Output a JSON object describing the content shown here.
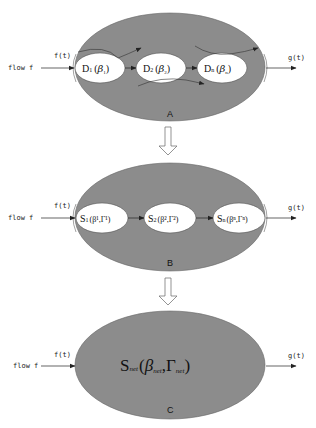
{
  "colors": {
    "outer_fill": "#8c8c8c",
    "inner_fill": "#ffffff",
    "line": "#222222"
  },
  "panels": [
    {
      "id": "A",
      "label": "A",
      "input_label": "flow f",
      "input_signal": "f(t)",
      "output_signal": "g(t)",
      "nodes": [
        {
          "name": "D",
          "index": "1",
          "open": "(",
          "param": "β",
          "param_sub": "1",
          "close": ")"
        },
        {
          "name": "D",
          "index": "2",
          "open": "(",
          "param": "β",
          "param_sub": "2",
          "close": ")"
        },
        {
          "name": "D",
          "index": "n",
          "open": "(",
          "param": "β",
          "param_sub": "n",
          "close": ")"
        }
      ]
    },
    {
      "id": "B",
      "label": "B",
      "input_label": "flow f",
      "input_signal": "f(t)",
      "output_signal": "g(t)",
      "nodes": [
        {
          "name": "S",
          "index": "1",
          "params": "(β¹,Γ¹)"
        },
        {
          "name": "S",
          "index": "2",
          "params": "(β²,Γ²)"
        },
        {
          "name": "S",
          "index": "n",
          "params": "(βⁿ,Γⁿ)"
        }
      ]
    },
    {
      "id": "C",
      "label": "C",
      "input_label": "flow f",
      "input_signal": "f(t)",
      "output_signal": "g(t)",
      "node": {
        "name": "S",
        "name_sub": "net",
        "open": "(",
        "param1": "β",
        "param1_sub": "net",
        "sep": ",",
        "param2": "Γ",
        "param2_sub": "net",
        "close": ")"
      }
    }
  ],
  "transition_arrows": [
    "A→B",
    "B→C"
  ]
}
